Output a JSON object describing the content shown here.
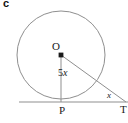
{
  "figure": {
    "item_letter": "c",
    "background_color": "#ffffff",
    "stroke_color": "#8a8a8a",
    "dot_color": "#1a1a1a",
    "text_color": "#1a1a1a",
    "labels": {
      "center": "O",
      "radius_number": "5",
      "radius_variable": "x",
      "tangent_point": "P",
      "external_point": "T",
      "angle": "x"
    },
    "geometry": {
      "circle_center_x": 61,
      "circle_center_y": 55,
      "circle_radius": 44,
      "tangent_line_y": 102,
      "tangent_line_x_start": 19,
      "tangent_line_x_end": 128,
      "point_p_x": 61,
      "point_p_y": 102,
      "point_t_x": 126,
      "point_t_y": 102,
      "radius_segment": "O to P (vertical, length 5x)",
      "hypotenuse_segment": "O to T"
    }
  }
}
